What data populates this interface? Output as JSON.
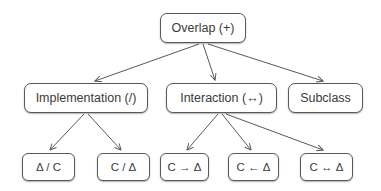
{
  "diagram": {
    "background_color": "#ffffff",
    "edge_color": "#58595b",
    "node_border_color": "#58595b",
    "node_text_color": "#3a3a3c",
    "root": {
      "label": "Overlap (+)"
    },
    "level2": [
      {
        "label": "Implementation (/)"
      },
      {
        "label": "Interaction (↔)"
      },
      {
        "label": "Subclass"
      }
    ],
    "level3": [
      {
        "label": "Δ / C"
      },
      {
        "label": "C / Δ"
      },
      {
        "label": "C → Δ"
      },
      {
        "label": "C ← Δ"
      },
      {
        "label": "C ↔ Δ"
      }
    ]
  }
}
